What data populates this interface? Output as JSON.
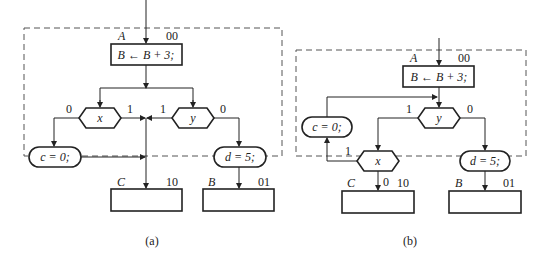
{
  "diagrams": [
    {
      "id": "a",
      "caption": "(a)",
      "state_A": {
        "name": "A",
        "code": "00",
        "action": "B ← B + 3;"
      },
      "decisions": [
        {
          "var": "x",
          "false_label": "0",
          "true_label": "1"
        },
        {
          "var": "y",
          "false_label": "1",
          "true_label": "0"
        }
      ],
      "conditional_outputs": [
        {
          "text": "c = 0;"
        },
        {
          "text": "d = 5;"
        }
      ],
      "state_C": {
        "name": "C",
        "code": "10"
      },
      "state_B": {
        "name": "B",
        "code": "01"
      }
    },
    {
      "id": "b",
      "caption": "(b)",
      "state_A": {
        "name": "A",
        "code": "00",
        "action": "B ← B + 3;"
      },
      "decisions": [
        {
          "var": "y",
          "true_label": "1",
          "false_label": "0"
        },
        {
          "var": "x",
          "true_label": "1",
          "false_label": "0"
        }
      ],
      "conditional_outputs": [
        {
          "text": "c = 0;"
        },
        {
          "text": "d = 5;"
        }
      ],
      "state_C": {
        "name": "C",
        "code": "10"
      },
      "state_B": {
        "name": "B",
        "code": "01"
      }
    }
  ]
}
